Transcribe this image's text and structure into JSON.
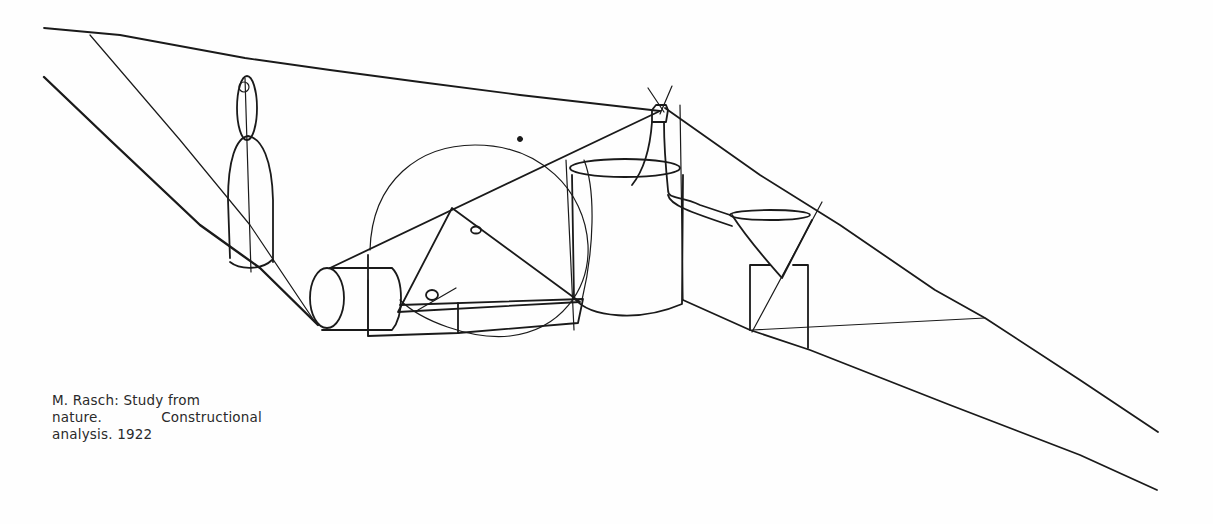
{
  "caption": {
    "line1_a": "M. Rasch: Study from",
    "line2_a": "nature.",
    "line2_b": "Constructional",
    "line3": "analysis. 1922"
  },
  "artwork": {
    "subject": "Constructional analysis line drawing of still-life objects",
    "objects": [
      "bottle",
      "sphere",
      "cylinder-lying",
      "jar",
      "carafe",
      "funnel-cone",
      "cube"
    ],
    "ink_color": "#1a1a1a",
    "paper_color": "#fefefe"
  }
}
